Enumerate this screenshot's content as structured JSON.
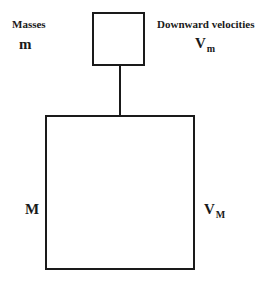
{
  "diagram": {
    "headers": {
      "left": "Masses",
      "right": "Downward velocities"
    },
    "small_mass": {
      "mass_label": "m",
      "velocity_label": "V",
      "velocity_subscript": "m"
    },
    "large_mass": {
      "mass_label": "M",
      "velocity_label": "V",
      "velocity_subscript": "M"
    },
    "connector": "rope connecting small mass to large mass"
  }
}
